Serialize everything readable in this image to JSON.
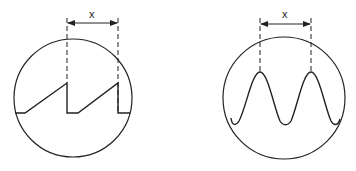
{
  "diagram": {
    "panels": [
      {
        "name": "sawtooth-waveform",
        "waveform": "sawtooth",
        "period_label": "x",
        "stroke": "#222222"
      },
      {
        "name": "sine-waveform",
        "waveform": "sine",
        "period_label": "x",
        "stroke": "#222222"
      }
    ]
  }
}
